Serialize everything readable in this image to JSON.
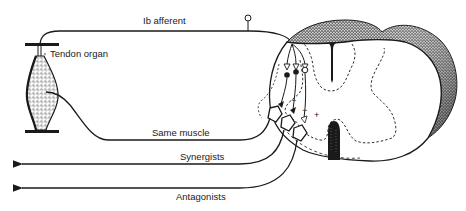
{
  "diagram": {
    "labels": {
      "ib_afferent": "Ib afferent",
      "tendon_organ": "Tendon organ",
      "same_muscle": "Same muscle",
      "synergists": "Synergists",
      "antagonists": "Antagonists"
    },
    "synapse_signs": {
      "inhibitory_1": "−",
      "inhibitory_2": "−",
      "excitatory": "+"
    },
    "colors": {
      "ink": "#1a1a1a",
      "background": "#ffffff",
      "stipple": "#444444"
    }
  }
}
